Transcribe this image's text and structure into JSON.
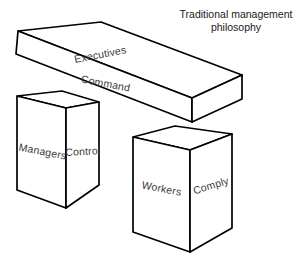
{
  "figure": {
    "title_line1": "Traditional management",
    "title_line2": "philosophy",
    "background_color": "#ffffff",
    "line_color": "#000000",
    "label_color": "#3a3a3a",
    "face_fill": "#ffffff"
  },
  "blocks": {
    "beam": {
      "name": "executives-beam",
      "top_face_label": "Executives",
      "front_face_label": "Command"
    },
    "left_box": {
      "name": "managers-box",
      "front_face_label": "Managers",
      "side_face_label": "Control"
    },
    "right_box": {
      "name": "workers-box",
      "front_face_label": "Workers",
      "side_face_label": "Comply"
    }
  }
}
